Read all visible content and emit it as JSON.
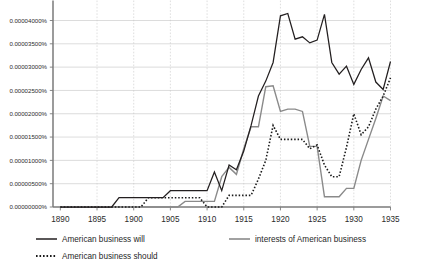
{
  "chart_data": {
    "type": "line",
    "title": "",
    "subtitle": "",
    "xlabel": "",
    "ylabel": "",
    "xlim": [
      1889,
      1935
    ],
    "ylim": [
      0.0,
      4e-05
    ],
    "grid": true,
    "legend_position": "bottom",
    "x_tick_labels": [
      "1890",
      "1895",
      "1900",
      "1905",
      "1910",
      "1915",
      "1920",
      "1925",
      "1930",
      "1935"
    ],
    "x_tick_values": [
      1890,
      1895,
      1900,
      1905,
      1910,
      1915,
      1920,
      1925,
      1930,
      1935
    ],
    "y_tick_labels": [
      "0.00000000%",
      "0.00000500%",
      "0.00001000%",
      "0.00001500%",
      "0.00002000%",
      "0.00002500%",
      "0.00003000%",
      "0.00003500%",
      "0.00004000%"
    ],
    "y_tick_values": [
      0.0,
      5e-06,
      1e-05,
      1.5e-05,
      2e-05,
      2.5e-05,
      3e-05,
      3.5e-05,
      4e-05
    ],
    "x": [
      1890,
      1891,
      1892,
      1893,
      1894,
      1895,
      1896,
      1897,
      1898,
      1899,
      1900,
      1901,
      1902,
      1903,
      1904,
      1905,
      1906,
      1907,
      1908,
      1909,
      1910,
      1911,
      1912,
      1913,
      1914,
      1915,
      1916,
      1917,
      1918,
      1919,
      1920,
      1921,
      1922,
      1923,
      1924,
      1925,
      1926,
      1927,
      1928,
      1929,
      1930,
      1931,
      1932,
      1933,
      1934,
      1935
    ],
    "series": [
      {
        "name": "American business will",
        "style": "solid",
        "color": "#231f20",
        "values": [
          0.0,
          0.0,
          0.0,
          0.0,
          0.0,
          0.0,
          0.0,
          0.0,
          2e-06,
          2e-06,
          2e-06,
          2e-06,
          2e-06,
          2e-06,
          2e-06,
          3.5e-06,
          3.5e-06,
          3.5e-06,
          3.5e-06,
          3.5e-06,
          3.5e-06,
          7.5e-06,
          3.5e-06,
          9e-06,
          8e-06,
          1.2e-05,
          1.75e-05,
          2.38e-05,
          2.7e-05,
          3.1e-05,
          4.1e-05,
          4.15e-05,
          3.6e-05,
          3.65e-05,
          3.52e-05,
          3.58e-05,
          4.13e-05,
          3.1e-05,
          2.85e-05,
          3.02e-05,
          2.63e-05,
          2.95e-05,
          3.2e-05,
          2.68e-05,
          2.52e-05,
          3.12e-05
        ]
      },
      {
        "name": "interests of American business",
        "style": "solid",
        "color": "#8a8a8a",
        "values": [
          0.0,
          0.0,
          0.0,
          0.0,
          0.0,
          0.0,
          0.0,
          0.0,
          0.0,
          0.0,
          0.0,
          0.0,
          0.0,
          0.0,
          0.0,
          0.0,
          0.0,
          1.2e-06,
          1.2e-06,
          1.2e-06,
          1.2e-06,
          1.2e-06,
          6.5e-06,
          8.5e-06,
          7e-06,
          1.25e-05,
          1.72e-05,
          1.72e-05,
          2.58e-05,
          2.6e-05,
          2.05e-05,
          2.1e-05,
          2.1e-05,
          2.05e-05,
          1.3e-05,
          1.3e-05,
          2.2e-06,
          2.2e-06,
          2.2e-06,
          4e-06,
          4e-06,
          1e-05,
          1.45e-05,
          1.9e-05,
          2.38e-05,
          2.28e-05
        ]
      },
      {
        "name": "American business should",
        "style": "dotted",
        "color": "#1a1a1a",
        "values": [
          0.0,
          0.0,
          0.0,
          0.0,
          0.0,
          0.0,
          0.0,
          0.0,
          0.0,
          0.0,
          0.0,
          0.0,
          2e-06,
          2e-06,
          2e-06,
          2e-06,
          2e-06,
          2e-06,
          2e-06,
          2e-06,
          0.0,
          0.0,
          0.0,
          2.5e-06,
          2.5e-06,
          2.5e-06,
          2.5e-06,
          6e-06,
          1e-05,
          1.75e-05,
          1.45e-05,
          1.45e-05,
          1.45e-05,
          1.45e-05,
          1.25e-05,
          1.33e-05,
          9e-06,
          6.5e-06,
          6.5e-06,
          1.28e-05,
          2e-05,
          1.55e-05,
          1.72e-05,
          2.1e-05,
          2.38e-05,
          2.77e-05
        ]
      }
    ]
  },
  "legend": {
    "items": [
      {
        "label": "American business will",
        "style": "solid-dark"
      },
      {
        "label": "interests of American business",
        "style": "solid-gray"
      },
      {
        "label": "American business should",
        "style": "dotted-dark"
      }
    ]
  }
}
